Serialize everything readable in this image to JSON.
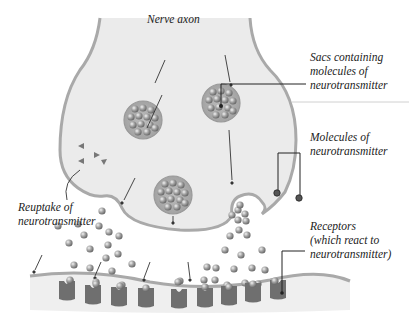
{
  "title": "Nerve axon",
  "labels": {
    "sacs": "Sacs containing\nmolecules of\nneurotransmitter",
    "molecules": "Molecules of\nneurotransmitter",
    "receptors": "Receptors\n(which react to\nneurotransmitter)",
    "reuptake": "Reuptake of\nneurotransmitter"
  },
  "colors": {
    "axon_fill": "#ebebeb",
    "membrane": "#a9a9a9",
    "receptor": "#6f6f6f",
    "molecule": "#9a9a9a",
    "leader_line": "#222222"
  }
}
